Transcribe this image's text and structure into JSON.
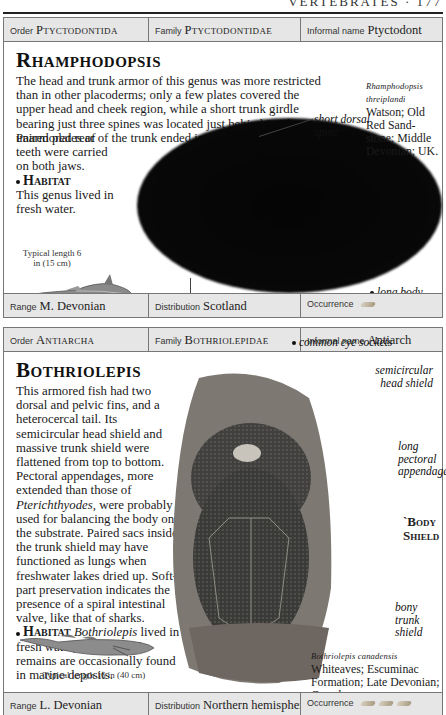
{
  "running_head": {
    "text": "VERTEBRATES · 177"
  },
  "entries": [
    {
      "bar_top": {
        "order_label": "Order",
        "order": "Ptyctodontida",
        "family_label": "Family",
        "family": "Ptyctodontidae",
        "informal_label": "Informal name",
        "informal": "Ptyctodont"
      },
      "title": "Rhamphodopsis",
      "description": "The head and trunk armor of this genus was more restricted than in other placoderms; only a few plates covered the upper head and cheek region, while a short trunk girdle bearing just three spines was located just behind it. The unarmored rear of the trunk ended in a whiplash tail.",
      "description2": "Paired plates of teeth were carried on both jaws.",
      "habitat_label": "Habitat",
      "habitat": "This genus lived in fresh water.",
      "specimen": {
        "name": "Rhamphodopsis threiplandi",
        "details": "Watson; Old Red Sand-stone; Middle Devonian; UK."
      },
      "labels": [
        "short dorsal spine",
        "long body",
        "unarmored flank"
      ],
      "typical_length": "Typical length 6 in (15 cm)",
      "bar_bottom": {
        "range_label": "Range",
        "range": "M. Devonian",
        "distribution_label": "Distribution",
        "distribution": "Scotland",
        "occurrence_label": "Occurrence",
        "occurrence_icons": 1
      }
    },
    {
      "bar_top": {
        "order_label": "Order",
        "order": "Antiarcha",
        "family_label": "Family",
        "family": "Bothriolepidae",
        "informal_label": "Informal name",
        "informal": "Antiarch"
      },
      "title": "Bothriolepis",
      "description_a": "This armored fish had two dorsal and pelvic fins, and a heterocercal tail. Its semicircular head shield and massive trunk shield were flattened from top to bottom. Pectoral appendages, more extended than those of ",
      "description_italic": "Pterichthyodes",
      "description_b": ", were probably used for balancing the body on the substrate. Paired sacs inside the trunk shield may have functioned as lungs when freshwater lakes dried up. Soft-part preservation indicates the presence of a spiral intestinal valve, like that of sharks.",
      "habitat_label": "Habitat",
      "habitat_italic": "Bothriolepis",
      "habitat": " lived in fresh water, but its fossil remains are occasionally found in marine deposits.",
      "specimen": {
        "name": "Bothriolepis canadensis",
        "details": "Whiteaves; Escuminac Formation; Late Devonian; Canada."
      },
      "labels": [
        "common eye sockets",
        "semicircular head shield",
        "long pectoral appendage",
        "bony trunk shield"
      ],
      "body_shield": "`Body Shield",
      "typical_length": "Typical length 16 in (40 cm)",
      "bar_bottom": {
        "range_label": "Range",
        "range": "L. Devonian",
        "distribution_label": "Distribution",
        "distribution": "Northern hemisphere",
        "occurrence_label": "Occurrence",
        "occurrence_icons": 3
      }
    }
  ]
}
